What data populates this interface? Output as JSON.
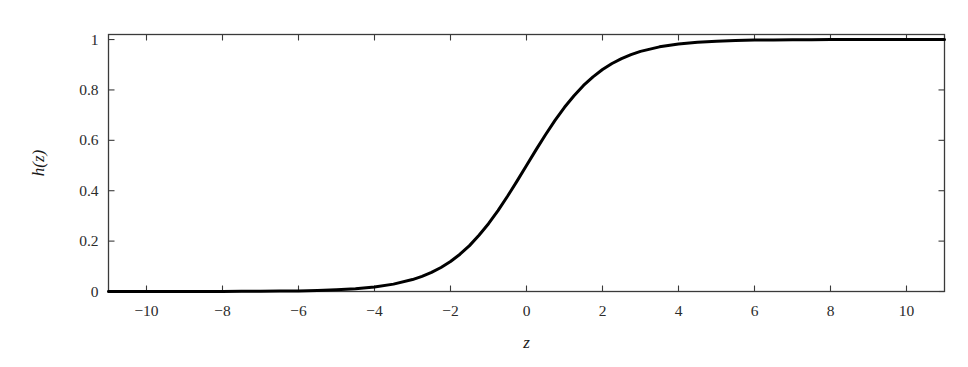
{
  "chart_data": {
    "type": "line",
    "title": "",
    "xlabel": "z",
    "ylabel": "h(z)",
    "xlim": [
      -11,
      11
    ],
    "ylim": [
      0,
      1.02
    ],
    "grid": false,
    "legend": null,
    "xticks": [
      -10,
      -8,
      -6,
      -4,
      -2,
      0,
      2,
      4,
      6,
      8,
      10
    ],
    "xtick_labels": [
      "−10",
      "−8",
      "−6",
      "−4",
      "−2",
      "0",
      "2",
      "4",
      "6",
      "8",
      "10"
    ],
    "yticks": [
      0,
      0.2,
      0.4,
      0.6,
      0.8,
      1
    ],
    "ytick_labels": [
      "0",
      "0.2",
      "0.4",
      "0.6",
      "0.8",
      "1"
    ],
    "series": [
      {
        "name": "h(z)",
        "color": "#000000",
        "line_width": 3,
        "formula": "logistic sigmoid  h(z) = 1 / (1 + e^(-z))",
        "x": [
          -11,
          -10.5,
          -10,
          -9.5,
          -9,
          -8.5,
          -8,
          -7.5,
          -7,
          -6.5,
          -6,
          -5.5,
          -5,
          -4.5,
          -4,
          -3.5,
          -3,
          -2.75,
          -2.5,
          -2.25,
          -2,
          -1.75,
          -1.5,
          -1.25,
          -1,
          -0.75,
          -0.5,
          -0.25,
          0,
          0.25,
          0.5,
          0.75,
          1,
          1.25,
          1.5,
          1.75,
          2,
          2.25,
          2.5,
          2.75,
          3,
          3.5,
          4,
          4.5,
          5,
          5.5,
          6,
          6.5,
          7,
          7.5,
          8,
          8.5,
          9,
          9.5,
          10,
          10.5,
          11
        ],
        "y": [
          1.7e-05,
          2.8e-05,
          4.5e-05,
          7.5e-05,
          0.000123,
          0.000203,
          0.000335,
          0.000553,
          0.000911,
          0.0015,
          0.00247,
          0.00407,
          0.00669,
          0.011,
          0.018,
          0.0293,
          0.0474,
          0.0601,
          0.0759,
          0.0952,
          0.119,
          0.148,
          0.182,
          0.223,
          0.269,
          0.321,
          0.378,
          0.438,
          0.5,
          0.562,
          0.622,
          0.679,
          0.731,
          0.777,
          0.818,
          0.852,
          0.881,
          0.905,
          0.924,
          0.94,
          0.953,
          0.971,
          0.982,
          0.989,
          0.993,
          0.996,
          0.998,
          0.998,
          0.999,
          0.999,
          1.0,
          1.0,
          1.0,
          1.0,
          1.0,
          1.0,
          1.0
        ]
      }
    ],
    "axes": {
      "frame_color": "#3a3a3a",
      "tick_direction": "in",
      "spines": [
        "left",
        "right",
        "top",
        "bottom"
      ]
    }
  }
}
